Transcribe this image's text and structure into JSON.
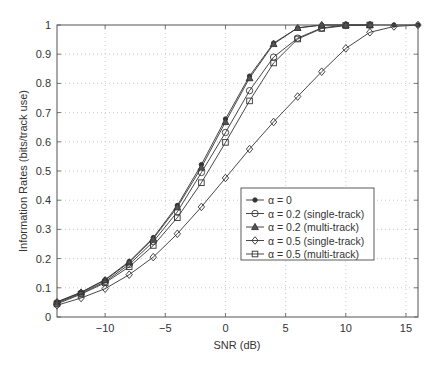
{
  "chart_data": {
    "type": "line",
    "title": "",
    "xlabel": "SNR (dB)",
    "ylabel": "Information Rates (bits/track use)",
    "xlim": [
      -14,
      16
    ],
    "ylim": [
      0,
      1
    ],
    "xticks": [
      -10,
      -5,
      0,
      5,
      10,
      15
    ],
    "xtick_labels": [
      "−10",
      "−5",
      "0",
      "5",
      "10",
      "15"
    ],
    "yticks": [
      0,
      0.1,
      0.2,
      0.3,
      0.4,
      0.5,
      0.6,
      0.7,
      0.8,
      0.9,
      1
    ],
    "ytick_labels": [
      "0",
      "0.1",
      "0.2",
      "0.3",
      "0.4",
      "0.5",
      "0.6",
      "0.7",
      "0.8",
      "0.9",
      "1"
    ],
    "grid": true,
    "legend_position": "center-right",
    "series": [
      {
        "name": "α = 0",
        "marker": "star",
        "x": [
          -14,
          -12,
          -10,
          -8,
          -6,
          -4,
          -2,
          0,
          2,
          4,
          6,
          8,
          10,
          12,
          14,
          16
        ],
        "values": [
          0.052,
          0.085,
          0.128,
          0.19,
          0.272,
          0.382,
          0.522,
          0.678,
          0.825,
          0.938,
          0.99,
          1.0,
          1.0,
          1.0,
          1.0,
          1.0
        ]
      },
      {
        "name": "α = 0.2 (single-track)",
        "marker": "circle",
        "x": [
          -14,
          -12,
          -10,
          -8,
          -6,
          -4,
          -2,
          0,
          2,
          4,
          6,
          8,
          10,
          12
        ],
        "values": [
          0.048,
          0.081,
          0.121,
          0.18,
          0.258,
          0.36,
          0.495,
          0.632,
          0.775,
          0.89,
          0.955,
          0.99,
          1.0,
          1.0
        ]
      },
      {
        "name": "α = 0.2 (multi-track)",
        "marker": "triangle",
        "x": [
          -14,
          -12,
          -10,
          -8,
          -6,
          -4,
          -2,
          0,
          2,
          4,
          6,
          8,
          10,
          12
        ],
        "values": [
          0.051,
          0.084,
          0.126,
          0.187,
          0.268,
          0.376,
          0.512,
          0.668,
          0.818,
          0.935,
          0.99,
          1.0,
          1.0,
          1.0
        ]
      },
      {
        "name": "α = 0.5 (single-track)",
        "marker": "diamond",
        "x": [
          -14,
          -12,
          -10,
          -8,
          -6,
          -4,
          -2,
          0,
          2,
          4,
          6,
          8,
          10,
          12,
          14,
          16
        ],
        "values": [
          0.04,
          0.065,
          0.097,
          0.145,
          0.205,
          0.285,
          0.377,
          0.476,
          0.575,
          0.668,
          0.755,
          0.84,
          0.92,
          0.975,
          0.995,
          1.0
        ]
      },
      {
        "name": "α = 0.5 (multi-track)",
        "marker": "square",
        "x": [
          -14,
          -12,
          -10,
          -8,
          -6,
          -4,
          -2,
          0,
          2,
          4,
          6,
          8,
          10,
          12
        ],
        "values": [
          0.045,
          0.078,
          0.117,
          0.172,
          0.245,
          0.34,
          0.46,
          0.598,
          0.74,
          0.87,
          0.952,
          0.988,
          0.998,
          1.0
        ]
      }
    ]
  },
  "colors": {
    "line": "#333333",
    "axis": "#555555",
    "grid": "#bbbbbb",
    "background": "#ffffff"
  }
}
